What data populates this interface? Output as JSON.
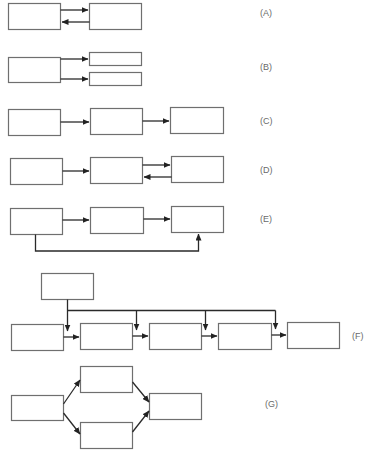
{
  "diagram": {
    "panels": [
      {
        "id": "A",
        "label": "(A)",
        "description": "two blocks with bidirectional arrows"
      },
      {
        "id": "B",
        "label": "(B)",
        "description": "one block feeding two blocks"
      },
      {
        "id": "C",
        "label": "(C)",
        "description": "three blocks in series"
      },
      {
        "id": "D",
        "label": "(D)",
        "description": "series with feedback between second and third block"
      },
      {
        "id": "E",
        "label": "(E)",
        "description": "series with bypass from first to third block"
      },
      {
        "id": "F",
        "label": "(F)",
        "description": "top block distributing to a chain of five blocks"
      },
      {
        "id": "G",
        "label": "(G)",
        "description": "parallel split and merge"
      }
    ]
  }
}
